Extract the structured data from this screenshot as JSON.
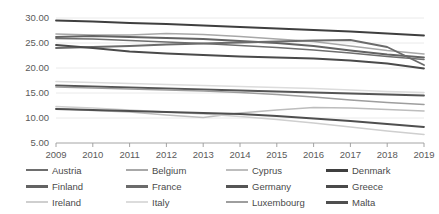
{
  "chart_data": {
    "type": "line",
    "title": "",
    "xlabel": "",
    "ylabel": "",
    "x": [
      2009,
      2010,
      2011,
      2012,
      2013,
      2014,
      2015,
      2016,
      2017,
      2018,
      2019
    ],
    "xtick_labels": [
      "2009",
      "2010",
      "2011",
      "2012",
      "2013",
      "2014",
      "2015",
      "2016",
      "2017",
      "2018",
      "2019"
    ],
    "ytick_labels": [
      "5.00",
      "10.00",
      "15.00",
      "20.00",
      "25.00",
      "30.00"
    ],
    "ytick_values": [
      5,
      10,
      15,
      20,
      25,
      30
    ],
    "ylim": [
      5,
      30
    ],
    "xlim": [
      2009,
      2019
    ],
    "grid": true,
    "legend_position": "bottom",
    "legend_columns": 4,
    "series": [
      {
        "name": "Austria",
        "color": "#6e6e6e",
        "width": 1.6,
        "values": [
          25.9,
          25.8,
          25.5,
          25.2,
          24.9,
          24.5,
          24.1,
          23.6,
          23.0,
          22.3,
          21.7
        ]
      },
      {
        "name": "Belgium",
        "color": "#a8a8a8",
        "width": 1.6,
        "values": [
          26.8,
          26.6,
          26.6,
          26.9,
          26.7,
          26.3,
          25.8,
          25.3,
          24.4,
          23.5,
          22.8
        ]
      },
      {
        "name": "Cyprus",
        "color": "#bdbdbd",
        "width": 1.6,
        "values": [
          11.9,
          11.5,
          11.2,
          10.6,
          10.1,
          11.0,
          11.6,
          12.1,
          12.0,
          11.7,
          11.4
        ]
      },
      {
        "name": "Denmark",
        "color": "#3f3f3f",
        "width": 1.8,
        "values": [
          29.5,
          29.3,
          29.0,
          28.8,
          28.5,
          28.2,
          27.9,
          27.6,
          27.3,
          26.9,
          26.5
        ]
      },
      {
        "name": "Finland",
        "color": "#636363",
        "width": 1.8,
        "values": [
          26.2,
          26.4,
          26.2,
          26.0,
          25.8,
          25.4,
          25.0,
          24.4,
          23.5,
          22.7,
          22.1
        ]
      },
      {
        "name": "France",
        "color": "#6b6b6b",
        "width": 1.8,
        "values": [
          24.0,
          24.2,
          24.4,
          24.7,
          24.9,
          25.1,
          25.3,
          25.5,
          25.6,
          24.2,
          20.6
        ]
      },
      {
        "name": "Germany",
        "color": "#555555",
        "width": 1.8,
        "values": [
          16.5,
          16.3,
          16.1,
          15.9,
          15.7,
          15.5,
          15.3,
          15.1,
          14.9,
          14.7,
          14.5
        ]
      },
      {
        "name": "Greece",
        "color": "#4a4a4a",
        "width": 1.8,
        "values": [
          24.6,
          24.0,
          23.3,
          22.9,
          22.6,
          22.3,
          22.1,
          21.9,
          21.5,
          20.9,
          19.9
        ]
      },
      {
        "name": "Ireland",
        "color": "#cfcfcf",
        "width": 1.6,
        "values": [
          12.3,
          12.0,
          11.6,
          11.2,
          10.8,
          10.3,
          9.7,
          9.0,
          8.2,
          7.4,
          6.7
        ]
      },
      {
        "name": "Italy",
        "color": "#dcdcdc",
        "width": 1.6,
        "values": [
          17.3,
          17.1,
          16.9,
          16.7,
          16.5,
          16.3,
          16.1,
          15.9,
          15.6,
          15.3,
          15.1
        ]
      },
      {
        "name": "Luxembourg",
        "color": "#9e9e9e",
        "width": 1.6,
        "values": [
          16.2,
          16.0,
          15.8,
          15.6,
          15.4,
          15.1,
          14.7,
          14.2,
          13.6,
          13.1,
          12.7
        ]
      },
      {
        "name": "Malta",
        "color": "#4f4f4f",
        "width": 1.8,
        "values": [
          11.8,
          11.6,
          11.4,
          11.2,
          11.0,
          10.8,
          10.4,
          9.9,
          9.4,
          8.8,
          8.2
        ]
      }
    ]
  },
  "legend": {
    "rows": [
      [
        "Austria",
        "Belgium",
        "Cyprus",
        "Denmark"
      ],
      [
        "Finland",
        "France",
        "Germany",
        "Greece"
      ],
      [
        "Ireland",
        "Italy",
        "Luxembourg",
        "Malta"
      ]
    ]
  }
}
